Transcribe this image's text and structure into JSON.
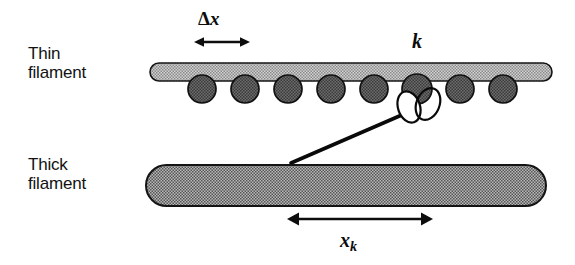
{
  "figure": {
    "background_color": "#ffffff",
    "width": 575,
    "height": 265
  },
  "labels": {
    "thin_filament": "Thin\nfilament",
    "thick_filament": "Thick\nfilament",
    "delta_symbol": "Δ",
    "delta_variable": "x",
    "spring_constant": "k",
    "displacement_variable": "x",
    "displacement_subscript": "k"
  },
  "colors": {
    "ink": "#0d0d0d",
    "thin_filament_fill": "#b4b4b4",
    "thin_filament_stroke": "#141414",
    "bead_fill": "#555555",
    "bead_stroke": "#111111",
    "thick_filament_fill": "#909090",
    "thick_filament_stroke": "#141414",
    "crossbridge_stroke": "#0a0a0a"
  },
  "diagram_data": {
    "type": "schematic",
    "thin_filament": {
      "x_start": 150,
      "x_end": 552,
      "y_top": 63,
      "y_bottom": 81,
      "cap": "rounded"
    },
    "bead_count": 8,
    "bead_positions_x": [
      202,
      245,
      288,
      331,
      374,
      417,
      460,
      503
    ],
    "bead_center_y": 89,
    "bead_radius": 14,
    "attached_bead_index": 5,
    "crossbridge": {
      "arm_from": [
        291,
        163
      ],
      "arm_to": [
        414,
        110
      ],
      "head_loops": 2
    },
    "thick_filament": {
      "x_start": 146,
      "x_end": 546,
      "y_top": 165,
      "y_bottom": 206,
      "cap": "rounded"
    },
    "delta_x_arrow": {
      "x_start": 196,
      "x_end": 248,
      "y": 42
    },
    "xk_arrow": {
      "x_start": 289,
      "x_end": 431,
      "y": 219
    }
  }
}
